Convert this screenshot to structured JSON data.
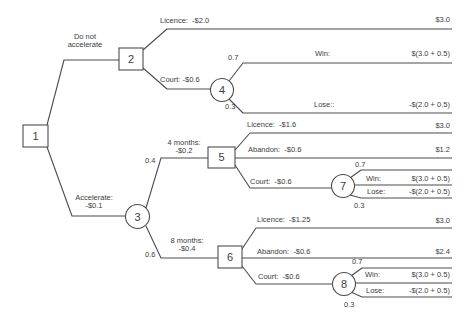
{
  "diagram_type": "decision-tree",
  "colors": {
    "line": "#4d4d4d",
    "text": "#3d3d3d",
    "background": "#ffffff"
  },
  "nodes": {
    "n1": "1",
    "n2": "2",
    "n3": "3",
    "n4": "4",
    "n5": "5",
    "n6": "6",
    "n7": "7",
    "n8": "8"
  },
  "labels": {
    "do_not_accelerate": "Do not\naccelerate",
    "accelerate": "Accelerate:\n-$0.1",
    "four_months": "4 months:\n-$0.2",
    "eight_months": "8 months:\n-$0.4",
    "licence_n2": "Licence:  -$2.0",
    "court_n2": "Court: -$0.6",
    "licence_n5": "Licence:  -$1.6",
    "abandon_n5": "Abandon:  -$0.6",
    "court_n5": "Court:  -$0.6",
    "licence_n6": "Licence:  -$1.25",
    "abandon_n6": "Abandon:  -$0.6",
    "court_n6": "Court:  -$0.6",
    "win_n4": "Win:",
    "lose_n4": "Lose::",
    "win_n7": "Win:",
    "lose_n7": "Lose:",
    "win_n8": "Win:",
    "lose_n8": "Lose:"
  },
  "probabilities": {
    "n4_win": "0.7",
    "n4_lose": "0.3",
    "n3_four_months": "0.4",
    "n3_eight_months": "0.6",
    "n7_win": "0.7",
    "n7_lose": "0.3",
    "n8_win": "0.7",
    "n8_lose": "0.3"
  },
  "payoffs": {
    "n2_licence": "$3.0",
    "n4_win": "$(3.0 + 0.5)",
    "n4_lose": "-$(2.0 + 0.5)",
    "n5_licence": "$3.0",
    "n5_abandon": "$1.2",
    "n7_win": "$(3.0 + 0.5)",
    "n7_lose": "-$(2.0 + 0.5)",
    "n6_licence": "$3.0",
    "n6_abandon": "$2.4",
    "n8_win": "$(3.0 + 0.5)",
    "n8_lose": "-$(2.0 + 0.5)"
  }
}
